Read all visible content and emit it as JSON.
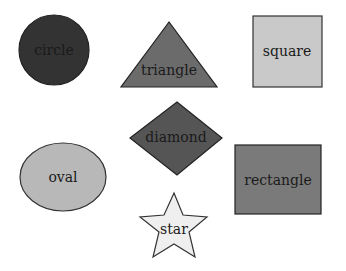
{
  "shapes": {
    "circle": {
      "label": "circle",
      "fill": "#333333"
    },
    "triangle": {
      "label": "triangle",
      "fill": "#6b6b6b"
    },
    "square": {
      "label": "square",
      "fill": "#c9c9c9"
    },
    "diamond": {
      "label": "diamond",
      "fill": "#555555"
    },
    "oval": {
      "label": "oval",
      "fill": "#b8b8b8"
    },
    "rectangle": {
      "label": "rectangle",
      "fill": "#7a7a7a"
    },
    "star": {
      "label": "star",
      "fill": "#efefef"
    }
  },
  "stroke": "#222222"
}
